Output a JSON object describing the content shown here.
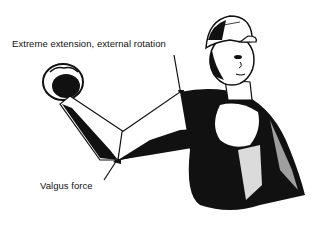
{
  "figure": {
    "labels": {
      "top": "Extreme extension, external rotation",
      "bottom": "Valgus force"
    },
    "colors": {
      "ink": "#111111",
      "background": "#ffffff"
    }
  }
}
